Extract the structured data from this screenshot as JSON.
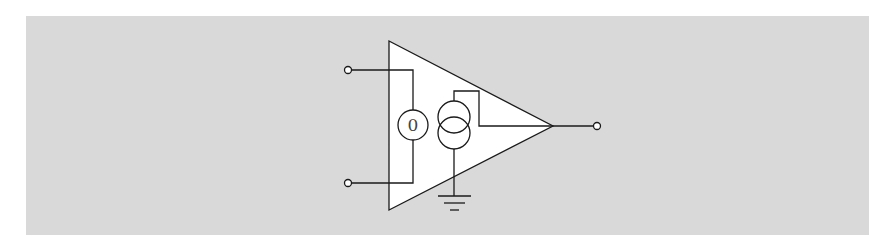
{
  "diagram": {
    "type": "circuit-schematic",
    "background_color": "#d9d9d9",
    "symbol_fill": "#ffffff",
    "line_color": "#1a1a1a",
    "components": {
      "amplifier": {
        "shape": "triangle"
      },
      "input_source": {
        "label": "0"
      },
      "output_source": {
        "type": "current-source"
      },
      "ground": {
        "type": "ground-symbol"
      }
    },
    "terminals": {
      "input_top": "input-terminal-top",
      "input_bottom": "input-terminal-bottom",
      "output": "output-terminal"
    }
  }
}
